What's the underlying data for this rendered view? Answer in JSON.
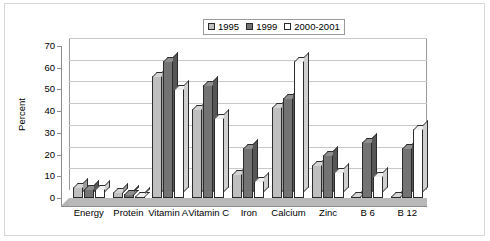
{
  "chart_data": {
    "type": "bar",
    "title": "",
    "xlabel": "",
    "ylabel": "Percent",
    "ylim": [
      0,
      70
    ],
    "ytick_step": 10,
    "yticks": [
      70,
      60,
      50,
      40,
      30,
      20,
      10,
      0
    ],
    "grid": true,
    "legend_position": "top",
    "style": "3d-clustered-column",
    "categories": [
      "Energy",
      "Protein",
      "Vitamin A",
      "Vitamin C",
      "Iron",
      "Calcium",
      "Zinc",
      "B 6",
      "B 12"
    ],
    "series": [
      {
        "name": "1995",
        "color": "#bfbfbf",
        "values": [
          5,
          3,
          56,
          41,
          11,
          42,
          15,
          1,
          1
        ]
      },
      {
        "name": "1999",
        "color": "#737373",
        "values": [
          4,
          2,
          63,
          52,
          23,
          46,
          20,
          26,
          23
        ]
      },
      {
        "name": "2000-2001",
        "color": "#ffffff",
        "values": [
          4,
          1,
          50,
          37,
          8,
          63,
          12,
          10,
          32
        ]
      }
    ]
  },
  "legend": {
    "items": [
      {
        "label": "1995",
        "swatch": "#bfbfbf"
      },
      {
        "label": "1999",
        "swatch": "#737373"
      },
      {
        "label": "2000-2001",
        "swatch": "#ffffff"
      }
    ]
  },
  "axis": {
    "y_title": "Percent",
    "y_tick_labels": [
      "70",
      "60",
      "50",
      "40",
      "30",
      "20",
      "10",
      "0"
    ]
  }
}
